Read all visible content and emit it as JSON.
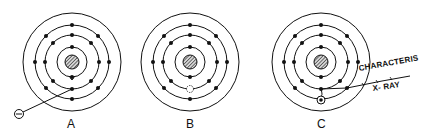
{
  "figure": {
    "panels": [
      {
        "id": "A",
        "label": "A",
        "description": "Incident electron strikes inner-shell electron",
        "vacancy": false,
        "incident_particle": "electron"
      },
      {
        "id": "B",
        "label": "B",
        "description": "Inner-shell vacancy created (dashed circle)",
        "vacancy": true
      },
      {
        "id": "C",
        "label": "C",
        "description": "Outer electron fills vacancy emitting characteristic X-ray",
        "vacancy": false
      }
    ],
    "incident_symbol": "⊖",
    "annotation": {
      "line1": "CHARACTERIS",
      "line2": "X- RAY"
    },
    "colors": {
      "ink": "#111111",
      "background": "#ffffff"
    }
  }
}
